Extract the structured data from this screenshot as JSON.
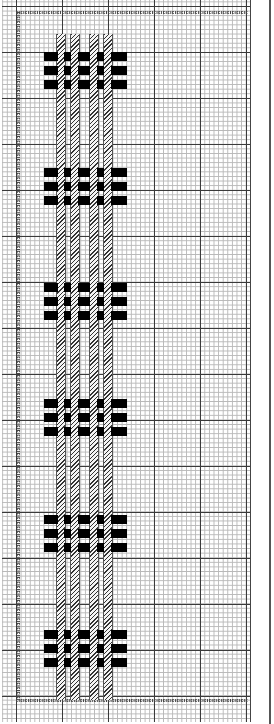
{
  "chart": {
    "title": "",
    "type": "cross-stitch / weaving pattern chart",
    "grid": {
      "minor_cell_px": 4.6,
      "major_every_cells": 10,
      "line_color_minor": "#b8b8b8",
      "line_color_major": "#3a3a3a"
    },
    "border": {
      "style": "chain-stitch",
      "top_y": 10,
      "bottom_y": 698,
      "left_x": 16,
      "right_x_end": 248,
      "color": "#444444"
    },
    "stripes": {
      "fill": "diagonal-hatch",
      "color": "#333333",
      "x_positions": [
        56,
        70,
        89,
        103
      ],
      "width": 8,
      "top_y": 34,
      "bottom_y": 700
    },
    "motifs": [
      {
        "label": "motif-1",
        "top_y": 52
      },
      {
        "label": "motif-2",
        "top_y": 168
      },
      {
        "label": "motif-3",
        "top_y": 283
      },
      {
        "label": "motif-4",
        "top_y": 399
      },
      {
        "label": "motif-5",
        "top_y": 515
      },
      {
        "label": "motif-6",
        "top_y": 630
      }
    ],
    "bar_rows_per_motif": 3,
    "bar_row_offsets": [
      0,
      14,
      28
    ],
    "bar_segments": [
      {
        "x": 44,
        "w": 14
      },
      {
        "x": 64,
        "w": 7
      },
      {
        "x": 78,
        "w": 12
      },
      {
        "x": 97,
        "w": 7
      },
      {
        "x": 111,
        "w": 16
      }
    ],
    "bar_color": "#000000"
  }
}
